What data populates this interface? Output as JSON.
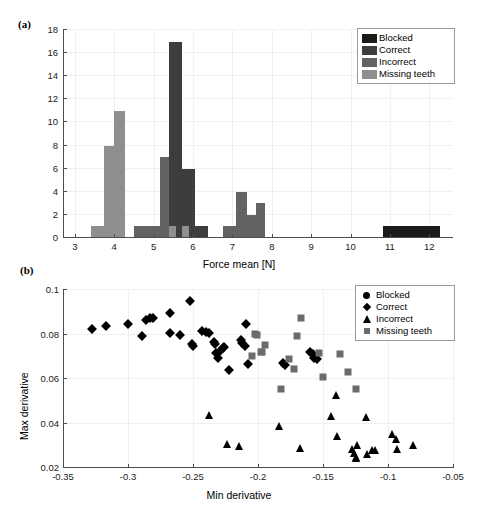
{
  "figure": {
    "panel_a_label": "(a)",
    "panel_b_label": "(b)"
  },
  "chart_data": [
    {
      "type": "bar",
      "panel": "(a)",
      "title": "",
      "xlabel": "Force mean [N]",
      "ylabel": "",
      "xlim": [
        2.7,
        12.6
      ],
      "ylim": [
        0,
        18
      ],
      "xticks": [
        3,
        4,
        5,
        6,
        7,
        8,
        9,
        10,
        11,
        12
      ],
      "yticks": [
        0,
        2,
        4,
        6,
        8,
        10,
        12,
        14,
        16,
        18
      ],
      "grid": true,
      "legend_position": "top-right",
      "bin_width": 0.33,
      "series": [
        {
          "name": "Blocked",
          "color": "#1a1a1a",
          "bars": [
            {
              "x0": 10.82,
              "x1": 12.28,
              "value": 1
            }
          ]
        },
        {
          "name": "Correct",
          "color": "#3d3d3d",
          "bars": [
            {
              "x0": 5.39,
              "x1": 5.72,
              "value": 17
            },
            {
              "x0": 5.72,
              "x1": 6.05,
              "value": 6
            },
            {
              "x0": 6.05,
              "x1": 6.38,
              "value": 1
            }
          ]
        },
        {
          "name": "Incorrect",
          "color": "#636363",
          "bars": [
            {
              "x0": 4.5,
              "x1": 4.83,
              "value": 1
            },
            {
              "x0": 4.83,
              "x1": 5.16,
              "value": 1
            },
            {
              "x0": 5.16,
              "x1": 5.39,
              "value": 7
            },
            {
              "x0": 6.75,
              "x1": 7.08,
              "value": 1
            },
            {
              "x0": 7.08,
              "x1": 7.38,
              "value": 4
            },
            {
              "x0": 7.38,
              "x1": 7.6,
              "value": 2
            },
            {
              "x0": 7.6,
              "x1": 7.83,
              "value": 3
            }
          ]
        },
        {
          "name": "Missing teeth",
          "color": "#8f8f8f",
          "bars": [
            {
              "x0": 3.4,
              "x1": 3.73,
              "value": 1
            },
            {
              "x0": 3.73,
              "x1": 4.0,
              "value": 8
            },
            {
              "x0": 4.0,
              "x1": 4.28,
              "value": 11
            },
            {
              "x0": 5.39,
              "x1": 5.56,
              "value": 1
            },
            {
              "x0": 5.72,
              "x1": 5.9,
              "value": 1
            }
          ]
        }
      ],
      "legend": [
        {
          "label": "Blocked",
          "color": "#1a1a1a"
        },
        {
          "label": "Correct",
          "color": "#3d3d3d"
        },
        {
          "label": "Incorrect",
          "color": "#636363"
        },
        {
          "label": "Missing teeth",
          "color": "#8f8f8f"
        }
      ]
    },
    {
      "type": "scatter",
      "panel": "(b)",
      "title": "",
      "xlabel": "Min derivative",
      "ylabel": "Max derivative",
      "xlim": [
        -0.35,
        -0.05
      ],
      "ylim": [
        0.02,
        0.1
      ],
      "xticks": [
        -0.35,
        -0.3,
        -0.25,
        -0.2,
        -0.15,
        -0.1,
        -0.05
      ],
      "xticklabels": [
        "-0.35",
        "-0.3",
        "-0.25",
        "-0.2",
        "-0.15",
        "-0.1",
        "-0.05"
      ],
      "yticks": [
        0.02,
        0.04,
        0.06,
        0.08,
        0.1
      ],
      "yticklabels": [
        "0.02",
        "0.04",
        "0.06",
        "0.08",
        "0.1"
      ],
      "grid": true,
      "legend_position": "top-right",
      "legend": [
        {
          "label": "Blocked",
          "marker": "circle",
          "color": "#000000"
        },
        {
          "label": "Correct",
          "marker": "diamond",
          "color": "#000000"
        },
        {
          "label": "Incorrect",
          "marker": "triangle",
          "color": "#000000"
        },
        {
          "label": "Missing teeth",
          "marker": "square",
          "color": "#6b6b6b"
        }
      ],
      "series": [
        {
          "name": "Blocked",
          "marker": "circle",
          "color": "#000000",
          "points": []
        },
        {
          "name": "Correct",
          "marker": "diamond",
          "color": "#000000",
          "points": [
            [
              -0.328,
              0.0825
            ],
            [
              -0.317,
              0.084
            ],
            [
              -0.3,
              0.0848
            ],
            [
              -0.289,
              0.0793
            ],
            [
              -0.286,
              0.0866
            ],
            [
              -0.283,
              0.0872
            ],
            [
              -0.281,
              0.0876
            ],
            [
              -0.268,
              0.0897
            ],
            [
              -0.268,
              0.0805
            ],
            [
              -0.26,
              0.08
            ],
            [
              -0.252,
              0.0951
            ],
            [
              -0.251,
              0.0757
            ],
            [
              -0.25,
              0.075
            ],
            [
              -0.243,
              0.0817
            ],
            [
              -0.24,
              0.081
            ],
            [
              -0.238,
              0.0806
            ],
            [
              -0.234,
              0.0768
            ],
            [
              -0.233,
              0.0757
            ],
            [
              -0.232,
              0.0719
            ],
            [
              -0.231,
              0.0694
            ],
            [
              -0.229,
              0.0727
            ],
            [
              -0.227,
              0.074
            ],
            [
              -0.226,
              0.0745
            ],
            [
              -0.222,
              0.0639
            ],
            [
              -0.213,
              0.0776
            ],
            [
              -0.212,
              0.0762
            ],
            [
              -0.21,
              0.0749
            ],
            [
              -0.209,
              0.0848
            ],
            [
              -0.208,
              0.0668
            ],
            [
              -0.181,
              0.0673
            ],
            [
              -0.179,
              0.0665
            ],
            [
              -0.16,
              0.0723
            ],
            [
              -0.158,
              0.0714
            ],
            [
              -0.157,
              0.0693
            ],
            [
              -0.155,
              0.0688
            ]
          ]
        },
        {
          "name": "Incorrect",
          "marker": "triangle",
          "color": "#000000",
          "points": [
            [
              -0.238,
              0.044
            ],
            [
              -0.224,
              0.0309
            ],
            [
              -0.215,
              0.0301
            ],
            [
              -0.184,
              0.0388
            ],
            [
              -0.168,
              0.0288
            ],
            [
              -0.144,
              0.0432
            ],
            [
              -0.14,
              0.053
            ],
            [
              -0.139,
              0.0343
            ],
            [
              -0.128,
              0.0284
            ],
            [
              -0.126,
              0.0267
            ],
            [
              -0.125,
              0.0249
            ],
            [
              -0.125,
              0.0245
            ],
            [
              -0.124,
              0.0303
            ],
            [
              -0.117,
              0.0428
            ],
            [
              -0.116,
              0.0262
            ],
            [
              -0.112,
              0.0283
            ],
            [
              -0.11,
              0.0282
            ],
            [
              -0.097,
              0.0354
            ],
            [
              -0.094,
              0.0329
            ],
            [
              -0.093,
              0.0284
            ],
            [
              -0.081,
              0.0302
            ]
          ]
        },
        {
          "name": "Missing teeth",
          "marker": "square",
          "color": "#6b6b6b",
          "points": [
            [
              -0.205,
              0.0703
            ],
            [
              -0.202,
              0.0803
            ],
            [
              -0.201,
              0.08
            ],
            [
              -0.198,
              0.0723
            ],
            [
              -0.197,
              0.0722
            ],
            [
              -0.195,
              0.0753
            ],
            [
              -0.182,
              0.0554
            ],
            [
              -0.176,
              0.0688
            ],
            [
              -0.172,
              0.0645
            ],
            [
              -0.17,
              0.0793
            ],
            [
              -0.167,
              0.0873
            ],
            [
              -0.153,
              0.0718
            ],
            [
              -0.15,
              0.0611
            ],
            [
              -0.137,
              0.0713
            ],
            [
              -0.131,
              0.0632
            ],
            [
              -0.125,
              0.0556
            ]
          ]
        }
      ]
    }
  ]
}
